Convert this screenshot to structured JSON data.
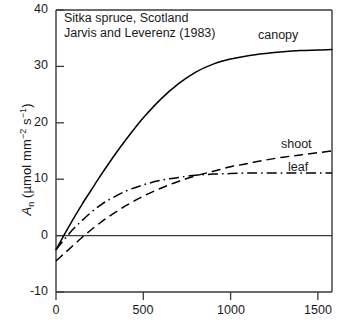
{
  "chart_data": {
    "type": "line",
    "title": "",
    "annotation": [
      "Sitka spruce, Scotland",
      "Jarvis and Leverenz (1983)"
    ],
    "xlabel": "",
    "ylabel": "An (umol m-2 s-1)",
    "xlim": [
      0,
      1580
    ],
    "ylim": [
      -10,
      40
    ],
    "xticks": [
      0,
      500,
      1000,
      1500
    ],
    "yticks": [
      -10,
      0,
      10,
      20,
      30,
      40
    ],
    "xtick_labels": [
      "0",
      "500",
      "1000",
      "1500"
    ],
    "ytick_labels": [
      "-10",
      "0",
      "10",
      "20",
      "30",
      "40"
    ],
    "grid": false,
    "legend_position": "inline-right-labels",
    "zero_line": 0,
    "series": [
      {
        "name": "canopy",
        "label": "canopy",
        "linestyle": "solid",
        "color": "#000000",
        "x": [
          0,
          50,
          100,
          150,
          200,
          250,
          300,
          350,
          400,
          450,
          500,
          600,
          700,
          800,
          900,
          1000,
          1100,
          1200,
          1300,
          1400,
          1500,
          1580
        ],
        "y": [
          -2.5,
          0.3,
          3.0,
          5.6,
          8.0,
          10.4,
          12.7,
          14.9,
          17.0,
          19.0,
          20.9,
          24.2,
          26.9,
          29.0,
          30.4,
          31.3,
          31.9,
          32.3,
          32.6,
          32.8,
          32.9,
          33.0
        ]
      },
      {
        "name": "shoot",
        "label": "shoot",
        "linestyle": "dashed",
        "color": "#000000",
        "x": [
          0,
          50,
          100,
          150,
          200,
          250,
          300,
          400,
          500,
          600,
          700,
          800,
          900,
          1000,
          1100,
          1200,
          1300,
          1400,
          1500,
          1580
        ],
        "y": [
          -4.5,
          -3.1,
          -1.7,
          -0.3,
          1.0,
          2.2,
          3.3,
          5.3,
          7.0,
          8.4,
          9.6,
          10.6,
          11.4,
          12.2,
          12.8,
          13.4,
          13.9,
          14.3,
          14.7,
          15.0
        ]
      },
      {
        "name": "leaf",
        "label": "leaf",
        "linestyle": "dashdot",
        "color": "#000000",
        "x": [
          0,
          50,
          100,
          150,
          200,
          250,
          300,
          400,
          500,
          600,
          700,
          800,
          900,
          1000,
          1100,
          1200,
          1300,
          1400,
          1500,
          1580
        ],
        "y": [
          -2.5,
          -0.6,
          1.2,
          2.7,
          4.1,
          5.3,
          6.3,
          7.9,
          9.0,
          9.8,
          10.3,
          10.7,
          10.9,
          11.0,
          11.1,
          11.1,
          11.1,
          11.1,
          11.1,
          11.1
        ]
      }
    ]
  },
  "axes": {
    "y_label_main": "A",
    "y_label_sub": "n",
    "y_label_unit_open": " (µmol m",
    "y_label_unit_sup1": "−2",
    "y_label_unit_mid": " s",
    "y_label_unit_sup2": "−1",
    "y_label_unit_close": ")"
  },
  "labels": {
    "canopy": "canopy",
    "shoot": "shoot",
    "leaf": "leaf",
    "annot_line1": "Sitka spruce, Scotland",
    "annot_line2": "Jarvis and Leverenz (1983)"
  },
  "ticks": {
    "x": [
      "0",
      "500",
      "1000",
      "1500"
    ],
    "y": [
      "40",
      "30",
      "20",
      "10",
      "0",
      "-10"
    ]
  },
  "colors": {
    "line": "#000000",
    "axis": "#3a3a3a",
    "background": "#ffffff"
  }
}
